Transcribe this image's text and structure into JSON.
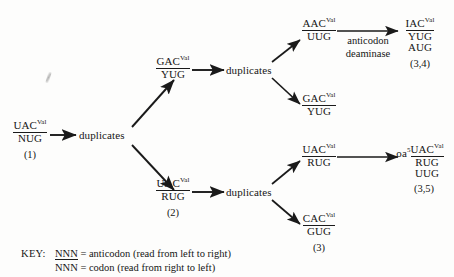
{
  "diagram": {
    "line_color": "#1a1a1a",
    "background": "#fdfdfc",
    "nodes": {
      "root": {
        "anticodon": "UAC",
        "superscript": "Val",
        "codon": "NUG",
        "ref": "(1)"
      },
      "dup_root": {
        "label": "duplicates"
      },
      "gac_yug_top": {
        "anticodon": "GAC",
        "superscript": "Val",
        "codon": "YUG"
      },
      "dup_top": {
        "label": "duplicates"
      },
      "aac_uug": {
        "anticodon": "AAC",
        "superscript": "Val",
        "codon": "UUG"
      },
      "gac_yug_branch": {
        "anticodon": "GAC",
        "superscript": "Val",
        "codon": "YUG"
      },
      "iac_yug_aug": {
        "anticodon": "IAC",
        "superscript": "Val",
        "codon": "YUG",
        "extra": "AUG",
        "ref": "(3,4)"
      },
      "uac_rug_mid": {
        "anticodon": "UAC",
        "superscript": "Val",
        "codon": "RUG",
        "ref": "(2)"
      },
      "dup_bottom": {
        "label": "duplicates"
      },
      "uac_rug_branch": {
        "anticodon": "UAC",
        "superscript": "Val",
        "codon": "RUG"
      },
      "cac_gug": {
        "anticodon": "CAC",
        "superscript": "Val",
        "codon": "GUG",
        "ref": "(3)"
      },
      "oa5_uac_rug_uug": {
        "prefix": "oa",
        "prefix_superscript": "5",
        "anticodon": "UAC",
        "superscript": "Val",
        "codon": "RUG",
        "extra": "UUG",
        "ref": "(3,5)"
      }
    },
    "edge_labels": {
      "deaminase": {
        "line1": "anticodon",
        "line2": "deaminase"
      }
    }
  },
  "key": {
    "label": "KEY:",
    "rows": [
      {
        "symbol": "NNN",
        "underlined": true,
        "text": "= anticodon (read from left to right)"
      },
      {
        "symbol": "NNN",
        "underlined": false,
        "text": "= codon (read from right to left)"
      }
    ]
  }
}
